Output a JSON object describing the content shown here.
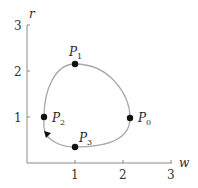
{
  "diagram": {
    "type": "phase-plane-orbit",
    "axes": {
      "x_label": "w",
      "y_label": "r",
      "x_ticks": [
        "1",
        "2",
        "3"
      ],
      "y_ticks": [
        "1",
        "2",
        "3"
      ],
      "x_range": [
        0,
        3
      ],
      "y_range": [
        0,
        3
      ]
    },
    "points": [
      {
        "name": "P",
        "sub": "0",
        "w": 2.15,
        "r": 1.0
      },
      {
        "name": "P",
        "sub": "1",
        "w": 1.0,
        "r": 2.15
      },
      {
        "name": "P",
        "sub": "2",
        "w": 0.35,
        "r": 1.0
      },
      {
        "name": "P",
        "sub": "3",
        "w": 1.0,
        "r": 0.35
      }
    ],
    "direction": "counterclockwise",
    "colors": {
      "axis": "#8a8a8a",
      "orbit": "#a8a8a8",
      "points": "#111111"
    }
  }
}
